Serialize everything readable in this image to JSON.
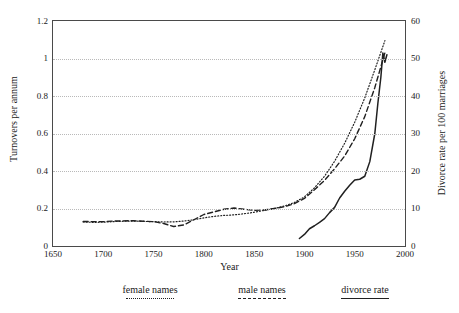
{
  "chart_data": {
    "type": "line",
    "title": "",
    "xlabel": "Year",
    "ylabel": "Turnovers per annum",
    "ylabel_right": "Divorce rate per 100 marriages",
    "xlim": [
      1650,
      2000
    ],
    "ylim": [
      0,
      1.2
    ],
    "ylim_right": [
      0,
      60
    ],
    "xticks": [
      1650,
      1700,
      1750,
      1800,
      1850,
      1900,
      1950,
      2000
    ],
    "xtick_labels": [
      "1650",
      "1700",
      "1750",
      "1800",
      "1850",
      "1900",
      "1950",
      "2000"
    ],
    "xticks_minor": [
      1675,
      1725,
      1775,
      1825,
      1875,
      1925,
      1975
    ],
    "yticks": [
      0,
      0.2,
      0.4,
      0.6,
      0.8,
      1.0,
      1.2
    ],
    "ytick_labels": [
      "0",
      "0.2",
      "0.4",
      "0.6",
      "0.8",
      "1",
      "1.2"
    ],
    "yticks_minor": [
      0.1,
      0.3,
      0.5,
      0.7,
      0.9,
      1.1
    ],
    "yticks_right": [
      0,
      10,
      20,
      30,
      40,
      50,
      60
    ],
    "ytick_right_labels": [
      "0",
      "10",
      "20",
      "30",
      "40",
      "50",
      "60"
    ],
    "yticks_right_minor": [
      5,
      15,
      25,
      35,
      45,
      55
    ],
    "grid": "horizontal-dotted",
    "legend_position": "below-plot",
    "series": [
      {
        "name": "female names",
        "style": "dotted",
        "axis": "left",
        "points": [
          [
            1680,
            0.128
          ],
          [
            1690,
            0.126
          ],
          [
            1700,
            0.127
          ],
          [
            1710,
            0.13
          ],
          [
            1720,
            0.132
          ],
          [
            1730,
            0.133
          ],
          [
            1740,
            0.131
          ],
          [
            1750,
            0.13
          ],
          [
            1760,
            0.128
          ],
          [
            1770,
            0.129
          ],
          [
            1780,
            0.133
          ],
          [
            1790,
            0.14
          ],
          [
            1800,
            0.15
          ],
          [
            1810,
            0.158
          ],
          [
            1820,
            0.163
          ],
          [
            1830,
            0.166
          ],
          [
            1840,
            0.172
          ],
          [
            1850,
            0.18
          ],
          [
            1860,
            0.19
          ],
          [
            1870,
            0.2
          ],
          [
            1880,
            0.213
          ],
          [
            1890,
            0.232
          ],
          [
            1900,
            0.262
          ],
          [
            1910,
            0.31
          ],
          [
            1920,
            0.372
          ],
          [
            1930,
            0.452
          ],
          [
            1940,
            0.548
          ],
          [
            1950,
            0.66
          ],
          [
            1960,
            0.79
          ],
          [
            1970,
            0.94
          ],
          [
            1980,
            1.095
          ]
        ]
      },
      {
        "name": "male names",
        "style": "dashed",
        "axis": "left",
        "points": [
          [
            1680,
            0.131
          ],
          [
            1690,
            0.13
          ],
          [
            1700,
            0.13
          ],
          [
            1710,
            0.133
          ],
          [
            1720,
            0.134
          ],
          [
            1730,
            0.135
          ],
          [
            1740,
            0.132
          ],
          [
            1750,
            0.13
          ],
          [
            1760,
            0.12
          ],
          [
            1770,
            0.104
          ],
          [
            1780,
            0.112
          ],
          [
            1790,
            0.14
          ],
          [
            1800,
            0.168
          ],
          [
            1810,
            0.182
          ],
          [
            1820,
            0.196
          ],
          [
            1830,
            0.203
          ],
          [
            1840,
            0.196
          ],
          [
            1850,
            0.19
          ],
          [
            1860,
            0.192
          ],
          [
            1870,
            0.2
          ],
          [
            1880,
            0.209
          ],
          [
            1890,
            0.226
          ],
          [
            1900,
            0.254
          ],
          [
            1910,
            0.3
          ],
          [
            1920,
            0.35
          ],
          [
            1930,
            0.412
          ],
          [
            1940,
            0.48
          ],
          [
            1950,
            0.572
          ],
          [
            1960,
            0.69
          ],
          [
            1970,
            0.845
          ],
          [
            1980,
            1.03
          ]
        ]
      },
      {
        "name": "divorce rate",
        "style": "solid",
        "axis": "right",
        "points": [
          [
            1895,
            2.0
          ],
          [
            1900,
            3.1
          ],
          [
            1905,
            4.6
          ],
          [
            1910,
            5.4
          ],
          [
            1915,
            6.3
          ],
          [
            1920,
            7.3
          ],
          [
            1925,
            8.9
          ],
          [
            1930,
            10.3
          ],
          [
            1935,
            12.8
          ],
          [
            1940,
            14.6
          ],
          [
            1945,
            16.2
          ],
          [
            1950,
            17.6
          ],
          [
            1955,
            17.8
          ],
          [
            1960,
            18.6
          ],
          [
            1965,
            22.5
          ],
          [
            1970,
            30.0
          ],
          [
            1973,
            38.0
          ],
          [
            1976,
            45.0
          ],
          [
            1978,
            51.5
          ],
          [
            1980,
            49.0
          ],
          [
            1982,
            51.0
          ]
        ]
      }
    ]
  },
  "legend": {
    "entries": [
      {
        "label": "female names",
        "style": "dotted"
      },
      {
        "label": "male names",
        "style": "dashed"
      },
      {
        "label": "divorce rate",
        "style": "solid"
      }
    ]
  },
  "colors": {
    "axis": "#4a4a4a",
    "grid": "#b9b9b9",
    "series": "#202020",
    "background": "#ffffff"
  }
}
